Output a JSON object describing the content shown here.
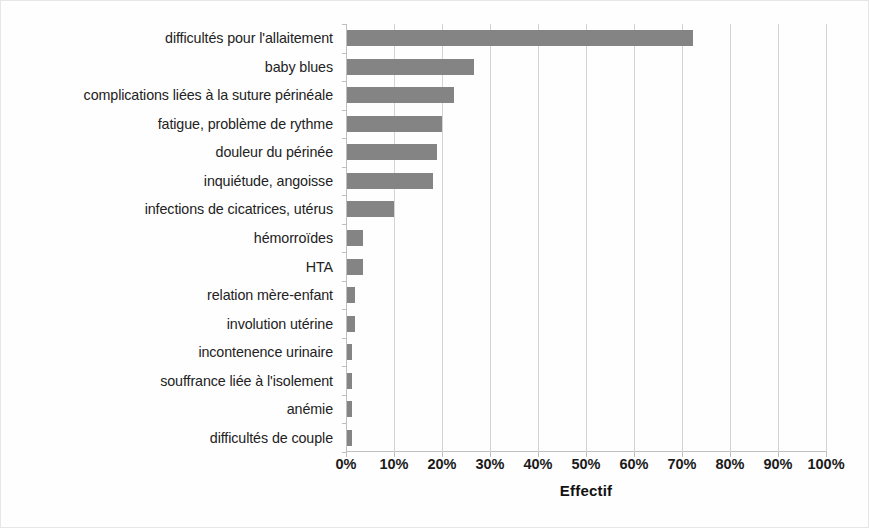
{
  "chart_data": {
    "type": "bar",
    "orientation": "horizontal",
    "title": "",
    "subtitle": "",
    "xlabel": "Effectif",
    "ylabel": "",
    "xlim": [
      0,
      100
    ],
    "xtick_labels": [
      "0%",
      "10%",
      "20%",
      "30%",
      "40%",
      "50%",
      "60%",
      "70%",
      "80%",
      "90%",
      "100%"
    ],
    "xtick_values": [
      0,
      10,
      20,
      30,
      40,
      50,
      60,
      70,
      80,
      90,
      100
    ],
    "grid": "vertical",
    "legend": "none",
    "units": "percent",
    "bar_color": "#848484",
    "gridline_color": "#d3d3d3",
    "axis_color": "#bfbfbf",
    "categories": [
      "difficultés pour l'allaitement",
      "baby blues",
      "complications liées à la suture périnéale",
      "fatigue, problème de rythme",
      "douleur du périnée",
      "inquiétude, angoisse",
      "infections de cicatrices, utérus",
      "hémorroïdes",
      "HTA",
      "relation mère-enfant",
      "involution utérine",
      "incontenence urinaire",
      "souffrance liée à l'isolement",
      "anémie",
      "difficultés de couple"
    ],
    "values": [
      72,
      26.5,
      22.3,
      19.8,
      18.8,
      18,
      9.8,
      3.4,
      3.4,
      1.7,
      1.7,
      1,
      1,
      1,
      1
    ]
  }
}
